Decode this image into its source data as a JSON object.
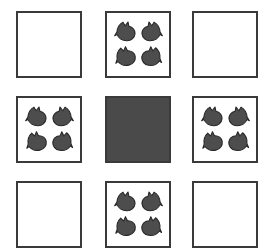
{
  "puzzle": {
    "type": "matrix-reasoning-grid",
    "rows": 3,
    "columns": 3,
    "colors": {
      "background": "#ffffff",
      "cell_border": "#3a3a3a",
      "cell_fill_empty": "#ffffff",
      "cell_fill_solid": "#4a4a4a",
      "shape_fill": "#4d4d4d",
      "shape_outline": "#262626"
    },
    "shape_name": "bird-silhouette",
    "shape_count_per_filled_cell": 4,
    "cells": [
      {
        "index": 1,
        "row": 0,
        "column": 0,
        "state": "empty",
        "shape_count": 0,
        "label": "cell-r1c1"
      },
      {
        "index": 2,
        "row": 0,
        "column": 1,
        "state": "shapes",
        "shape_count": 4,
        "label": "cell-r1c2"
      },
      {
        "index": 3,
        "row": 0,
        "column": 2,
        "state": "empty",
        "shape_count": 0,
        "label": "cell-r1c3"
      },
      {
        "index": 4,
        "row": 1,
        "column": 0,
        "state": "shapes",
        "shape_count": 4,
        "label": "cell-r2c1"
      },
      {
        "index": 5,
        "row": 1,
        "column": 1,
        "state": "solid",
        "shape_count": 0,
        "label": "cell-r2c2"
      },
      {
        "index": 6,
        "row": 1,
        "column": 2,
        "state": "shapes",
        "shape_count": 4,
        "label": "cell-r2c3"
      },
      {
        "index": 7,
        "row": 2,
        "column": 0,
        "state": "empty",
        "shape_count": 0,
        "label": "cell-r3c1"
      },
      {
        "index": 8,
        "row": 2,
        "column": 1,
        "state": "shapes",
        "shape_count": 4,
        "label": "cell-r3c2"
      },
      {
        "index": 9,
        "row": 2,
        "column": 2,
        "state": "empty",
        "shape_count": 0,
        "label": "cell-r3c3"
      }
    ]
  }
}
